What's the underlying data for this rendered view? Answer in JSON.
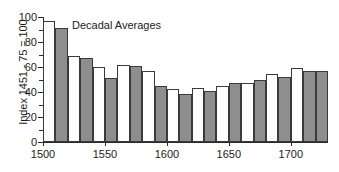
{
  "chart_data": {
    "type": "bar",
    "title": "",
    "annotation": "Decadal Averages",
    "xlabel": "",
    "ylabel": "Index 1451 - 75 = 100",
    "xlim": [
      1500,
      1730
    ],
    "ylim": [
      0,
      100
    ],
    "ytick_values": [
      0,
      20,
      40,
      60,
      80,
      100
    ],
    "ytick_labels": [
      "0",
      "20",
      "40",
      "60",
      "80",
      "100"
    ],
    "yminor_values": [
      10,
      30,
      50,
      70,
      90
    ],
    "xtick_values": [
      1500,
      1550,
      1600,
      1650,
      1700
    ],
    "xtick_labels": [
      "1500",
      "1550",
      "1600",
      "1650",
      "1700"
    ],
    "grid": false,
    "legend": null,
    "bar_colors": {
      "light": "#fefefe",
      "dark": "#8e8e8e",
      "outline": "#3a3a3a"
    },
    "categories": [
      "1500",
      "1510",
      "1520",
      "1530",
      "1540",
      "1550",
      "1560",
      "1570",
      "1580",
      "1590",
      "1600",
      "1610",
      "1620",
      "1630",
      "1640",
      "1650",
      "1660",
      "1670",
      "1680",
      "1690",
      "1700",
      "1710",
      "1720"
    ],
    "values": [
      97,
      91,
      68.5,
      67,
      60,
      51,
      62,
      61,
      56.5,
      44.5,
      42.5,
      38.5,
      43,
      41,
      45,
      47.5,
      47,
      49.5,
      54.5,
      52,
      59.5,
      57,
      57
    ],
    "shades": [
      "light",
      "dark",
      "light",
      "dark",
      "light",
      "dark",
      "light",
      "dark",
      "light",
      "dark",
      "light",
      "dark",
      "light",
      "dark",
      "light",
      "dark",
      "light",
      "dark",
      "light",
      "dark",
      "light",
      "dark",
      "dark"
    ]
  }
}
